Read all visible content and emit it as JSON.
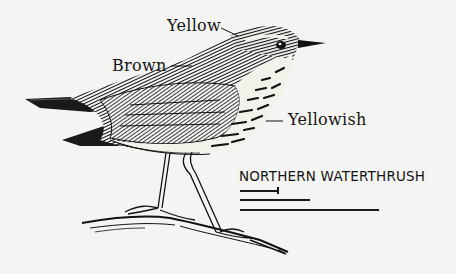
{
  "figure": {
    "subject": "Northern Waterthrush",
    "title": "NORTHERN WATERTHRUSH",
    "labels": [
      {
        "id": "crown-stripe",
        "text": "Yellow"
      },
      {
        "id": "back",
        "text": "Brown"
      },
      {
        "id": "underparts",
        "text": "Yellowish"
      }
    ],
    "scale_bars": [
      {
        "length_px": 39,
        "has_tick": true
      },
      {
        "length_px": 70,
        "has_tick": false
      },
      {
        "length_px": 139,
        "has_tick": false
      }
    ]
  },
  "colors": {
    "ink": "#141414",
    "paper": "#f4f4f2"
  }
}
